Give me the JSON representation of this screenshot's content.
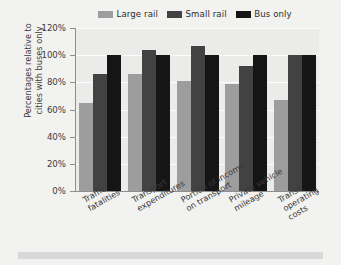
{
  "chart_data": {
    "type": "bar",
    "title": "",
    "xlabel": "",
    "ylabel": "Percentages relative to cities with buses only",
    "ylabel_lines": [
      "Percentages relative to",
      "cities with buses only"
    ],
    "categories": [
      "Traffic fatalities",
      "Transport expenditures",
      "Portion of income on transport",
      "Private vehicle mileage",
      "Transit operating costs"
    ],
    "category_lines": [
      [
        "Traffic",
        "fatalities"
      ],
      [
        "Transport",
        "expenditures"
      ],
      [
        "Portion of income",
        "on transport"
      ],
      [
        "Private vehicle",
        "mileage"
      ],
      [
        "Transit",
        "operating",
        "costs"
      ]
    ],
    "series": [
      {
        "name": "Large rail",
        "color": "#9d9d9d",
        "values": [
          65,
          86,
          81,
          79,
          67
        ]
      },
      {
        "name": "Small rail",
        "color": "#424242",
        "values": [
          86,
          104,
          107,
          92,
          100
        ]
      },
      {
        "name": "Bus only",
        "color": "#151515",
        "values": [
          100,
          100,
          100,
          100,
          100
        ]
      }
    ],
    "ylim": [
      0,
      120
    ],
    "ytick_values": [
      0,
      20,
      40,
      60,
      80,
      100,
      120
    ],
    "ytick_labels": [
      "0%",
      "20%",
      "40%",
      "60%",
      "80%",
      "100%",
      "120%"
    ],
    "grid": true,
    "grid_color": "#fdfdfd",
    "legend_position": "top",
    "plot_background": "#ebebe9",
    "axis_color": "#8e8e8e",
    "page_background": "#f2f2f0",
    "footer_band_color": "#d8d8d8"
  }
}
